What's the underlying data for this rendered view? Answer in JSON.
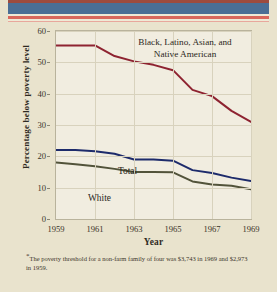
{
  "chart_data": {
    "type": "line",
    "title": "",
    "xlabel": "Year",
    "ylabel": "Percentage below poverty level",
    "xlim": [
      1959,
      1969
    ],
    "ylim": [
      0,
      60
    ],
    "yticks": [
      0,
      10,
      20,
      30,
      40,
      50,
      60
    ],
    "xticks": [
      1959,
      1961,
      1963,
      1965,
      1967,
      1969
    ],
    "xtick_labels": [
      "1959",
      "1961",
      "1963",
      "1965",
      "1967",
      "1969"
    ],
    "grid": true,
    "legend": "inline-annotations",
    "x": [
      1959,
      1960,
      1961,
      1962,
      1963,
      1964,
      1965,
      1966,
      1967,
      1968,
      1969
    ],
    "series": [
      {
        "name": "Black, Latino, Asian, and Native American",
        "color": "#8e2331",
        "values": [
          55.4,
          55.4,
          55.4,
          52.0,
          50.3,
          49.2,
          47.5,
          41.2,
          39.2,
          34.5,
          31.0
        ]
      },
      {
        "name": "Total",
        "color": "#1d2b6b",
        "values": [
          22.0,
          22.0,
          21.6,
          20.8,
          19.0,
          19.0,
          18.6,
          15.6,
          14.7,
          13.2,
          12.1
        ]
      },
      {
        "name": "White",
        "color": "#52533a",
        "values": [
          18.0,
          17.5,
          16.8,
          16.0,
          15.0,
          15.0,
          14.9,
          12.0,
          11.0,
          10.6,
          9.5
        ]
      }
    ],
    "annotations": [
      {
        "name": "minority-label",
        "text": "Black, Latino, Asian, and\nNative American"
      },
      {
        "name": "total-label",
        "text": "Total"
      },
      {
        "name": "white-label",
        "text": "White"
      }
    ]
  },
  "axis": {
    "ylabel": "Percentage below poverty level",
    "xlabel": "Year",
    "yticks": [
      "0",
      "10",
      "20",
      "30",
      "40",
      "50",
      "60"
    ],
    "xticks": [
      "1959",
      "1961",
      "1963",
      "1965",
      "1967",
      "1969"
    ]
  },
  "annotations": {
    "minority_line1": "Black, Latino, Asian, and",
    "minority_line2": "Native American",
    "total": "Total",
    "white": "White"
  },
  "footnote": {
    "marker": "*",
    "text": "The poverty threshold for a non-farm family of four was  $3,743 in 1969 and $2,973 in 1959."
  },
  "colors": {
    "page_background": "#e9e3cd",
    "plot_background": "#f1ede0",
    "band_blue": "#4a6e95",
    "band_red": "#d9675c",
    "band_darkred": "#9d4b3e",
    "minority_line": "#8e2331",
    "total_line": "#1d2b6b",
    "white_line": "#52533a",
    "grid": "#d8d2bd",
    "frame": "#b9b39c",
    "text": "#2e2a22"
  }
}
